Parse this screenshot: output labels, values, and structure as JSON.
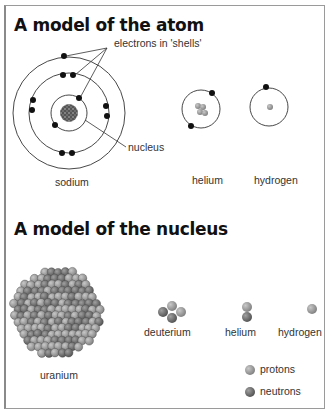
{
  "atom_section": {
    "title": "A model of the atom",
    "callouts": {
      "electrons": "electrons in 'shells'",
      "nucleus": "nucleus"
    },
    "atoms": [
      {
        "name": "sodium",
        "shells": [
          2,
          8,
          1
        ]
      },
      {
        "name": "helium",
        "electrons": 2
      },
      {
        "name": "hydrogen",
        "electrons": 1
      }
    ]
  },
  "nucleus_section": {
    "title": "A model of the nucleus",
    "nuclei": [
      {
        "name": "uranium"
      },
      {
        "name": "deuterium"
      },
      {
        "name": "helium"
      },
      {
        "name": "hydrogen"
      }
    ],
    "legend": [
      {
        "label": "protons",
        "color": "#9a9a9a"
      },
      {
        "label": "neutrons",
        "color": "#6e6e6e"
      }
    ]
  },
  "colors": {
    "electron": "#111111",
    "proton": "#9a9a9a",
    "neutron": "#6e6e6e",
    "orbit": "#333333"
  }
}
